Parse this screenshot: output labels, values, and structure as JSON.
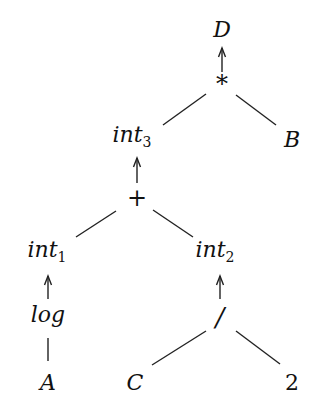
{
  "diagram": {
    "type": "expression-tree",
    "nodes": {
      "D": {
        "label": "D",
        "x": 222,
        "y": 37
      },
      "mul": {
        "label": "*",
        "x": 222,
        "y": 92
      },
      "int3": {
        "label": "int",
        "sub": "3",
        "x": 137,
        "y": 142
      },
      "B": {
        "label": "B",
        "x": 292,
        "y": 147
      },
      "plus": {
        "label": "+",
        "x": 137,
        "y": 205
      },
      "int1": {
        "label": "int",
        "sub": "1",
        "x": 52,
        "y": 257
      },
      "int2": {
        "label": "int",
        "sub": "2",
        "x": 220,
        "y": 257
      },
      "log": {
        "label": "log",
        "x": 48,
        "y": 320
      },
      "div": {
        "label": "/",
        "x": 220,
        "y": 360
      },
      "A": {
        "label": "A",
        "x": 48,
        "y": 390
      },
      "C": {
        "label": "C",
        "x": 135,
        "y": 390
      },
      "two": {
        "label": "2",
        "x": 292,
        "y": 390
      }
    },
    "edges": [
      {
        "from": "mul",
        "to": "D",
        "style": "arrow"
      },
      {
        "from": "int3",
        "to": "mul",
        "style": "line"
      },
      {
        "from": "B",
        "to": "mul",
        "style": "line"
      },
      {
        "from": "plus",
        "to": "int3",
        "style": "arrow"
      },
      {
        "from": "int1",
        "to": "plus",
        "style": "line"
      },
      {
        "from": "int2",
        "to": "plus",
        "style": "line"
      },
      {
        "from": "log",
        "to": "int1",
        "style": "arrow"
      },
      {
        "from": "A",
        "to": "log",
        "style": "line"
      },
      {
        "from": "div",
        "to": "int2",
        "style": "arrow"
      },
      {
        "from": "C",
        "to": "div",
        "style": "line"
      },
      {
        "from": "two",
        "to": "div",
        "style": "line"
      }
    ]
  }
}
